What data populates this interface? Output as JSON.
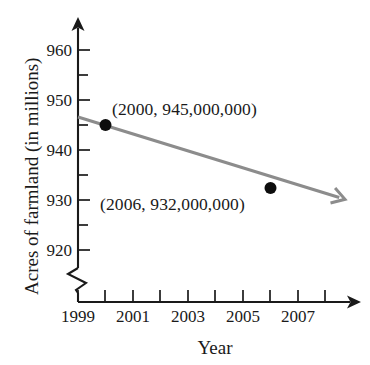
{
  "chart_data": {
    "type": "line",
    "title": "",
    "subtitle": "",
    "xlabel": "Year",
    "ylabel": "Acres of farmland (in millions)",
    "xlim": [
      1999,
      2008.6
    ],
    "ylim": [
      916,
      962
    ],
    "grid": false,
    "legend": null,
    "axis_break_y": true,
    "x_tick_labels": [
      "1999",
      "2001",
      "2003",
      "2005",
      "2007"
    ],
    "x_tick_label_values": [
      1999,
      2001,
      2003,
      2005,
      2007
    ],
    "x_ticks_all": [
      1999,
      2000,
      2001,
      2002,
      2003,
      2004,
      2005,
      2006,
      2007,
      2008
    ],
    "y_tick_labels": [
      "920",
      "930",
      "940",
      "950",
      "960"
    ],
    "y_tick_label_values": [
      920,
      930,
      940,
      950,
      960
    ],
    "y_ticks_minor": [
      925,
      935,
      945,
      955
    ],
    "series": [
      {
        "name": "Acres of farmland",
        "color": "#8c8c8c",
        "x": [
          1999,
          2008.5
        ],
        "y": [
          946.6,
          930.5
        ],
        "arrow_end": true
      }
    ],
    "points": [
      {
        "x": 2000,
        "y": 945,
        "label": "(2000, 945,000,000)",
        "marker": "filled-circle",
        "color": "#0d0d0d"
      },
      {
        "x": 2006,
        "y": 932.4,
        "label": "(2006, 932,000,000)",
        "marker": "filled-circle",
        "color": "#0d0d0d"
      }
    ],
    "annotations": [
      {
        "text": "(2000, 945,000,000)",
        "x": 2000,
        "y": 945
      },
      {
        "text": "(2006, 932,000,000)",
        "x": 2006,
        "y": 932
      }
    ],
    "colors": {
      "axis": "#1a1a1a",
      "trend_line": "#8c8c8c",
      "marker": "#0d0d0d",
      "background": "#ffffff",
      "text": "#1a1a1a"
    }
  },
  "labels": {
    "y_960": "960",
    "y_950": "950",
    "y_940": "940",
    "y_930": "930",
    "y_920": "920",
    "x_1999": "1999",
    "x_2001": "2001",
    "x_2003": "2003",
    "x_2005": "2005",
    "x_2007": "2007",
    "axis_title_x": "Year",
    "axis_title_y": "Acres of farmland (in millions)",
    "annotation_1": "(2000, 945,000,000)",
    "annotation_2": "(2006, 932,000,000)"
  }
}
